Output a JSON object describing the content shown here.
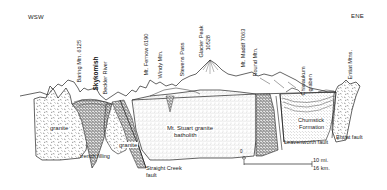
{
  "diagram": {
    "type": "geologic-cross-section",
    "orientation": {
      "left": "WSW",
      "right": "ENE"
    },
    "peaks": [
      {
        "id": "baring",
        "label": "Baring Mtn. 6125"
      },
      {
        "id": "skykomish",
        "label": "Skykomish"
      },
      {
        "id": "beckler",
        "label": "Beckler River"
      },
      {
        "id": "fernow",
        "label": "Mt. Fernow 6190"
      },
      {
        "id": "windy",
        "label": "Windy Mtn."
      },
      {
        "id": "stevens",
        "label": "Stevens Pass"
      },
      {
        "id": "glacier",
        "label": "Glacier Peak",
        "elevation": "10528"
      },
      {
        "id": "maddf",
        "label": "Mt. Maddf   7063"
      },
      {
        "id": "round",
        "label": "Round Mtn."
      },
      {
        "id": "chiwaukum",
        "label": "Chiwaukum",
        "label2": "graben"
      },
      {
        "id": "entiat_mtns",
        "label": "Entiat Mtns."
      }
    ],
    "units": [
      {
        "id": "granite_left",
        "label": "granite"
      },
      {
        "id": "trench",
        "label": "trench filling"
      },
      {
        "id": "granite_mid",
        "label": "granite"
      },
      {
        "id": "straight_creek",
        "label": "Straight Creek",
        "label2": "fault"
      },
      {
        "id": "stuart",
        "label": "Mt. Stuart granite",
        "label2": "batholith"
      },
      {
        "id": "chumstick",
        "label": "Chumstick",
        "label2": "Formation"
      },
      {
        "id": "leavenworth",
        "label": "Leavenworth fault"
      },
      {
        "id": "entiat_fault",
        "label": "Entiat fault"
      }
    ],
    "scale": {
      "start": "0",
      "miles": "10 mi.",
      "km": "16 km."
    }
  }
}
